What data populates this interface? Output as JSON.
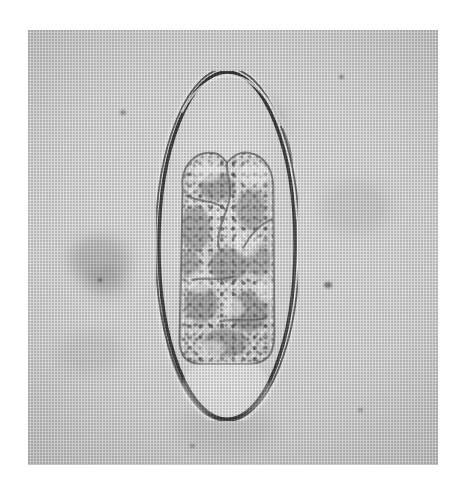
{
  "image": {
    "kind": "photomicrograph",
    "subject": "operculated helminth egg (trematode ovum) in wet mount",
    "modality": "brightfield light microscopy",
    "reproduction": "halftone-screened printed plate, scanned",
    "color_mode": "grayscale / monochrome",
    "orientation": "egg long axis vertical",
    "alt_text": "Grayscale light-microscope photograph of a single oval, thin-shelled parasite egg standing upright on a pale mottled background; a dark double-contoured shell outlines the egg and a coarsely granular embryonic cell mass fills the upper two thirds of its interior."
  },
  "canvas": {
    "width_px": 462,
    "height_px": 480,
    "page_background": "#ffffff"
  },
  "photo_plate": {
    "label": "photomicrograph plate",
    "left_px": 28,
    "top_px": 30,
    "width_px": 410,
    "height_px": 435,
    "field_tone": "#d3d3d3",
    "border": "untrimmed white paper margin on all four sides"
  },
  "specimen": {
    "name": "parasite egg",
    "common_description": "operculated ovum with embryonic mass",
    "bounding_box_px": {
      "x": 156,
      "y": 71,
      "width": 142,
      "height": 353
    },
    "shape": "elongate ellipse / ovoid, slightly narrower at the apical pole",
    "shell": {
      "name": "egg shell (chorion)",
      "appearance": "thin, sharply refractile double-contoured wall",
      "line_color": "#1d1d1d",
      "thickness_px": 3,
      "double_contour": true,
      "notes": "a second, fainter parallel contour runs just outside the main outline, most obvious along the right flank and across the lower pole where three lines are resolved"
    },
    "operculum": {
      "name": "operculum / apical pole",
      "position": "top",
      "visible": true,
      "notes": "slight shoulder and change of curvature near the apical pole"
    },
    "abopercular_pole": {
      "name": "abopercular pole",
      "position": "bottom",
      "notes": "broadly rounded, clear fluid-filled space between the cell mass and the shell"
    },
    "contents": {
      "name": "embryonic cell mass",
      "bounding_box_px": {
        "x": 167,
        "y": 154,
        "width": 122,
        "height": 214
      },
      "appearance": "coarsely granular, mottled light-and-dark blastomere mass with two rounded lobes at its upper margin and a flat, truncated lower margin",
      "fills_fraction_of_egg": "about two thirds, occupying the upper and middle portion",
      "clear_space": "optically empty, pale region between the cell mass and the lower pole of the shell"
    }
  },
  "background": {
    "name": "mounting medium and debris field",
    "description": "pale, slightly uneven grey field with faint out-of-focus amorphous debris and a few small dark specks",
    "debris": [
      {
        "name": "debris-smudge-left",
        "x": 95,
        "y": 252,
        "size_px": 46,
        "tone": "grey, diffuse"
      },
      {
        "name": "debris-smudge-upper",
        "x": 232,
        "y": 118,
        "size_px": 64,
        "tone": "faint grey halo"
      },
      {
        "name": "debris-speck-right",
        "x": 327,
        "y": 285,
        "size_px": 7,
        "tone": "dark"
      },
      {
        "name": "debris-speck-top",
        "x": 341,
        "y": 78,
        "size_px": 5,
        "tone": "dark"
      },
      {
        "name": "debris-speck-upper-left",
        "x": 122,
        "y": 112,
        "size_px": 6,
        "tone": "dark"
      },
      {
        "name": "debris-speck-lower",
        "x": 192,
        "y": 447,
        "size_px": 5,
        "tone": "dark"
      }
    ]
  },
  "palette": {
    "paper_white": "#ffffff",
    "field_light": "#dadada",
    "field_mid": "#cccccc",
    "field_dark": "#bcbcbc",
    "shell_line": "#1d1d1d",
    "granule_dark": "#2a2a2a",
    "granule_light": "#f2f2f2"
  },
  "annotations": {
    "scale_bar": null,
    "text_labels": [],
    "arrows": [],
    "note": "no scale bar, caption text, arrows or magnification legend are printed within the image area"
  }
}
